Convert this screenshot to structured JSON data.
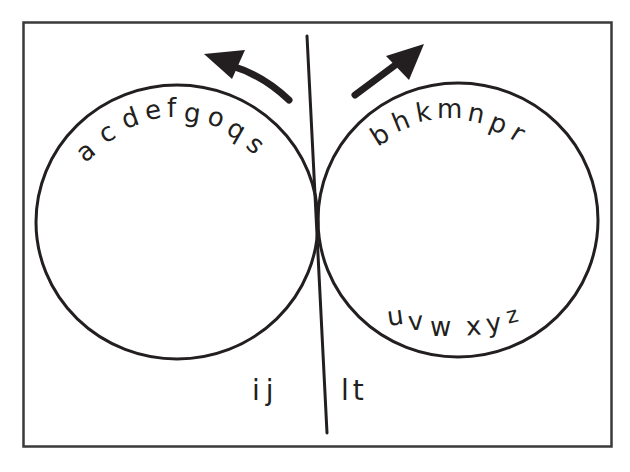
{
  "diagram": {
    "type": "letter-sort-venn",
    "stroke_color": "#231f20",
    "frame_color": "#3a3a3a",
    "background": "#ffffff",
    "left_circle": {
      "arc_letters": [
        "a",
        "c",
        "d",
        "e",
        "f",
        "g",
        "o",
        "q",
        "s"
      ],
      "arrow_direction": "up-left"
    },
    "right_circle": {
      "arc_letters": [
        "b",
        "h",
        "k",
        "m",
        "n",
        "p",
        "r"
      ],
      "bottom_letters": [
        "u",
        "v",
        "w",
        "x",
        "y",
        "z"
      ],
      "arrow_direction": "up-right"
    },
    "outside_left_of_line": "ij",
    "outside_right_of_line": "lt"
  }
}
